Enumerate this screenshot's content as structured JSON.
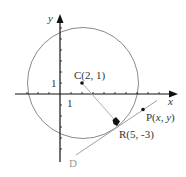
{
  "diagram": {
    "type": "coordinate-geometry",
    "axes": {
      "x_label": "x",
      "y_label": "y",
      "x_tick_label": "1",
      "y_tick_label": "1",
      "x_range": [
        -4,
        10
      ],
      "y_range": [
        -6,
        7
      ]
    },
    "circle": {
      "center": [
        2,
        1
      ],
      "radius": 5,
      "color": "#8a8a8a"
    },
    "points": [
      {
        "id": "C",
        "label": "C(2, 1)",
        "coords": [
          2,
          1
        ]
      },
      {
        "id": "R",
        "label": "R(5, -3)",
        "coords": [
          5,
          -3
        ]
      },
      {
        "id": "P",
        "label_prefix": "P(",
        "label_x": "x",
        "label_sep": ", ",
        "label_y": "y",
        "label_suffix": ")"
      }
    ],
    "lines": [
      {
        "id": "radius-CR",
        "from": "C",
        "to": "R",
        "color": "#b0b0b0"
      },
      {
        "id": "tangent-D",
        "label": "D",
        "through": [
          "R",
          "P"
        ],
        "color": "#a0a0a0"
      }
    ]
  }
}
